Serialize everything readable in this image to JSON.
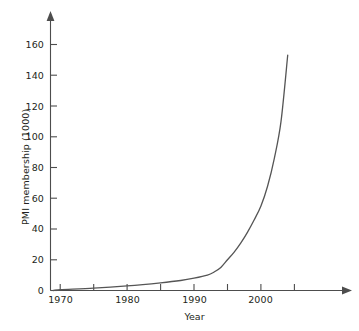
{
  "chart_data": {
    "type": "line",
    "title": "",
    "xlabel": "Year",
    "ylabel": "PMI membership (1000)",
    "xlim": [
      1968,
      2011
    ],
    "ylim": [
      0,
      172
    ],
    "grid": false,
    "legend": null,
    "x_ticks": [
      1970,
      1975,
      1980,
      1985,
      1990,
      1995,
      2000,
      2005
    ],
    "x_tick_labels": [
      "1970",
      "",
      "1980",
      "",
      "1990",
      "",
      "2000",
      ""
    ],
    "y_ticks": [
      0,
      20,
      40,
      60,
      80,
      100,
      120,
      140,
      160
    ],
    "y_tick_labels": [
      "0",
      "20",
      "40",
      "60",
      "80",
      "100",
      "120",
      "140",
      "160"
    ],
    "series": [
      {
        "name": "PMI membership",
        "color": "#555555",
        "x": [
          1969,
          1970,
          1975,
          1980,
          1985,
          1988,
          1990,
          1992,
          1993,
          1994,
          1995,
          1996,
          1997,
          1998,
          1999,
          2000,
          2001,
          2002,
          2003,
          2004
        ],
        "values": [
          0,
          0.5,
          1.5,
          3,
          5,
          6.5,
          8,
          10,
          12,
          15,
          20,
          25,
          31,
          38,
          46,
          55,
          68,
          86,
          110,
          153
        ]
      }
    ],
    "axis_color": "#4d4d4d",
    "line_color": "#555555"
  }
}
